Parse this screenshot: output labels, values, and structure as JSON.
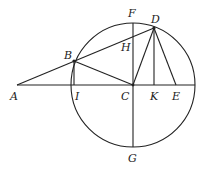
{
  "diagram": {
    "type": "geometry",
    "circle": {
      "center": "C",
      "cx": 133,
      "cy": 85,
      "r": 62
    },
    "points": {
      "A": {
        "x": 17,
        "y": 85,
        "label": "A",
        "lx": 10,
        "ly": 100
      },
      "B": {
        "x": 74,
        "y": 61,
        "label": "B",
        "lx": 64,
        "ly": 59
      },
      "C": {
        "x": 133,
        "y": 85,
        "label": "C",
        "lx": 121,
        "ly": 100
      },
      "D": {
        "x": 154,
        "y": 28,
        "label": "D",
        "lx": 151,
        "ly": 23
      },
      "E": {
        "x": 176,
        "y": 85,
        "label": "E",
        "lx": 172,
        "ly": 100
      },
      "F": {
        "x": 133,
        "y": 23,
        "label": "F",
        "lx": 128,
        "ly": 17
      },
      "G": {
        "x": 133,
        "y": 147,
        "label": "G",
        "lx": 128,
        "ly": 162
      },
      "H": {
        "x": 133,
        "y": 46,
        "label": "H",
        "lx": 121,
        "ly": 51
      },
      "I": {
        "x": 74,
        "y": 85,
        "label": "I",
        "lx": 75,
        "ly": 100
      },
      "K": {
        "x": 154,
        "y": 85,
        "label": "K",
        "lx": 150,
        "ly": 100
      }
    },
    "segments": [
      [
        "A",
        "D"
      ],
      [
        "A",
        "R"
      ],
      [
        "F",
        "G"
      ],
      [
        "B",
        "I"
      ],
      [
        "B",
        "C"
      ],
      [
        "C",
        "D"
      ],
      [
        "D",
        "K"
      ],
      [
        "D",
        "E"
      ]
    ],
    "extra_points": {
      "R": {
        "x": 195,
        "y": 85
      }
    }
  }
}
